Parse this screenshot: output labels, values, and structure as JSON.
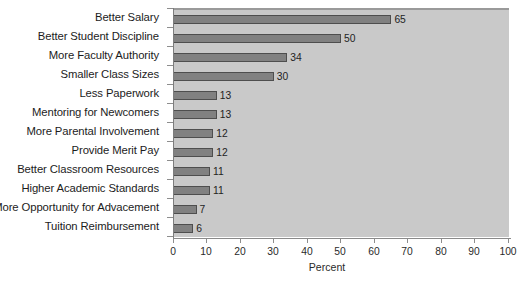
{
  "chart_data": {
    "type": "bar",
    "orientation": "horizontal",
    "title": "",
    "xlabel": "Percent",
    "ylabel": "",
    "xlim": [
      0,
      100
    ],
    "xticks": [
      0,
      10,
      20,
      30,
      40,
      50,
      60,
      70,
      80,
      90,
      100
    ],
    "grid": false,
    "legend": null,
    "categories": [
      "Better Salary",
      "Better Student Discipline",
      "More Faculty Authority",
      "Smaller Class Sizes",
      "Less Paperwork",
      "Mentoring for Newcomers",
      "More Parental Involvement",
      "Provide Merit Pay",
      "Better Classroom Resources",
      "Higher Academic Standards",
      "More Opportunity for Advacement",
      "Tuition Reimbursement"
    ],
    "values": [
      65,
      50,
      34,
      30,
      13,
      13,
      12,
      12,
      11,
      11,
      7,
      6
    ],
    "value_labels": [
      "65",
      "50",
      "34",
      "30",
      "13",
      "13",
      "12",
      "12",
      "11",
      "11",
      "7",
      "6"
    ],
    "colors": {
      "plot_background": "#c9c9c9",
      "page_background": "#ffffff",
      "bar_fill": "#818181",
      "bar_edge": "#4e4e4e",
      "axis": "#8a8a8a",
      "text": "#1c1c1c"
    }
  }
}
